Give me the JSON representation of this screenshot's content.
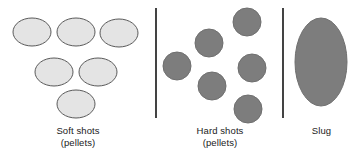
{
  "figure": {
    "width": 359,
    "height": 165,
    "background_color": "#ffffff"
  },
  "colors": {
    "soft_shot_fill": "#e4e4e4",
    "soft_shot_stroke": "#5a5a5a",
    "hard_shot_fill": "#7d7d7d",
    "hard_shot_stroke": "#6f6f6f",
    "slug_fill": "#7d7d7d",
    "slug_stroke": "#6f6f6f",
    "divider_color": "#151515",
    "text_color": "#1a1a1a"
  },
  "panels": [
    {
      "id": "soft-shots",
      "caption_line1": "Soft shots",
      "caption_line2": "(pellets)",
      "shape": "ellipse",
      "count": 6,
      "items": [
        {
          "cx": 32,
          "cy": 32,
          "rx": 19,
          "ry": 14
        },
        {
          "cx": 76,
          "cy": 32,
          "rx": 19,
          "ry": 14
        },
        {
          "cx": 119,
          "cy": 33,
          "rx": 19,
          "ry": 14
        },
        {
          "cx": 54,
          "cy": 72,
          "rx": 19,
          "ry": 14
        },
        {
          "cx": 98,
          "cy": 72,
          "rx": 19,
          "ry": 14
        },
        {
          "cx": 76,
          "cy": 104,
          "rx": 19,
          "ry": 14
        }
      ]
    },
    {
      "id": "hard-shots",
      "caption_line1": "Hard shots",
      "caption_line2": "(pellets)",
      "shape": "circle",
      "count": 6,
      "items": [
        {
          "cx": 247,
          "cy": 22,
          "rx": 14,
          "ry": 14
        },
        {
          "cx": 209,
          "cy": 43,
          "rx": 14,
          "ry": 14
        },
        {
          "cx": 177,
          "cy": 66,
          "rx": 14,
          "ry": 14
        },
        {
          "cx": 252,
          "cy": 68,
          "rx": 14,
          "ry": 14
        },
        {
          "cx": 212,
          "cy": 86,
          "rx": 14,
          "ry": 14
        },
        {
          "cx": 248,
          "cy": 109,
          "rx": 14,
          "ry": 14
        }
      ]
    },
    {
      "id": "slug",
      "caption_line1": "Slug",
      "caption_line2": "",
      "shape": "ellipse",
      "count": 1,
      "items": [
        {
          "cx": 321,
          "cy": 62,
          "rx": 26,
          "ry": 44
        }
      ]
    }
  ],
  "dividers": [
    {
      "id": "divider-left",
      "x": 156,
      "y1": 8,
      "y2": 118
    },
    {
      "id": "divider-right",
      "x": 283,
      "y1": 8,
      "y2": 118
    }
  ]
}
